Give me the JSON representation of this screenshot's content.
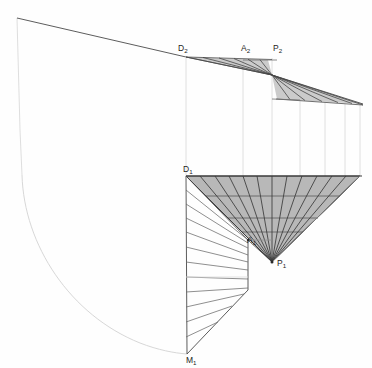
{
  "drawing": {
    "title": "Descriptive geometry construction: two-view projection of a conical surface",
    "type": "technical-line-drawing",
    "canvas": {
      "width": 372,
      "height": 368,
      "background": "#fefefe"
    },
    "colors": {
      "dark_line": "#3a3a3a",
      "medium_line": "#5d5d5d",
      "light_line": "#c9c9c9",
      "very_light_line": "#dcdcdc",
      "gray_fill": "#b8b8b8",
      "label_text": "#232323"
    },
    "labels": [
      {
        "name": "label-d2",
        "base": "D",
        "sub": "2",
        "x": 178,
        "y": 51
      },
      {
        "name": "label-a2",
        "base": "A",
        "sub": "2",
        "x": 243,
        "y": 51
      },
      {
        "name": "label-p2",
        "base": "P",
        "sub": "2",
        "x": 274,
        "y": 51
      },
      {
        "name": "label-d1",
        "base": "D",
        "sub": "1",
        "x": 183,
        "y": 173
      },
      {
        "name": "label-a1",
        "base": "A",
        "sub": "1",
        "x": 249,
        "y": 243
      },
      {
        "name": "label-p1",
        "base": "P",
        "sub": "1",
        "x": 277,
        "y": 266
      },
      {
        "name": "label-m1",
        "base": "M",
        "sub": "1",
        "x": 187,
        "y": 362
      }
    ],
    "points": [
      {
        "name": "point-p2",
        "x": 272,
        "y": 75,
        "marker": false
      },
      {
        "name": "point-p1",
        "x": 272,
        "y": 262,
        "marker": true
      },
      {
        "name": "point-a1",
        "x": 248,
        "y": 240,
        "marker": true
      },
      {
        "name": "point-d1",
        "x": 186,
        "y": 176,
        "marker": false
      },
      {
        "name": "point-d2",
        "x": 186,
        "y": 57,
        "marker": false
      },
      {
        "name": "point-m1",
        "x": 187,
        "y": 354,
        "marker": false
      }
    ],
    "projectors": {
      "name": "vertical-projector-lines",
      "y_top": 18,
      "y_bottom": 176,
      "x_positions": [
        186,
        243,
        272,
        300,
        325,
        345,
        360
      ]
    },
    "outer_curve": {
      "name": "large-arc-envelope",
      "start": {
        "x": 17,
        "y": 18
      },
      "end": {
        "x": 187,
        "y": 354
      },
      "description": "near-vertical left edge descending then sweeping right as a large circular arc to M1"
    },
    "upper_view": {
      "name": "front-view-fan",
      "apex": {
        "x": 272,
        "y": 75
      },
      "left_fan_base_y": 60,
      "left_fan_base_x_range": [
        186,
        268
      ],
      "right_fan_base_y_range": [
        98,
        106
      ],
      "right_fan_base_x_range": [
        277,
        363
      ],
      "ray_count_left": 6,
      "ray_count_right": 6
    },
    "lower_view": {
      "name": "top-view-triangle-and-fan",
      "gray_triangle": {
        "name": "shaded-cone-projection",
        "top_left": {
          "x": 186,
          "y": 176
        },
        "top_right": {
          "x": 360,
          "y": 176
        },
        "apex": {
          "x": 272,
          "y": 262
        },
        "fill": "#b8b8b8",
        "horizontal_chords_y": [
          196,
          218,
          232
        ],
        "radial_ray_count": 12
      },
      "left_fan": {
        "name": "unrolled-development-fan",
        "vertical_edge": {
          "x": 186,
          "y_top": 176,
          "y_bottom": 354
        },
        "right_edge_vertical": {
          "x": 248,
          "y_top": 240,
          "y_bottom": 290
        },
        "apex_bottom": {
          "x": 187,
          "y": 354
        },
        "ray_count": 11
      }
    }
  }
}
